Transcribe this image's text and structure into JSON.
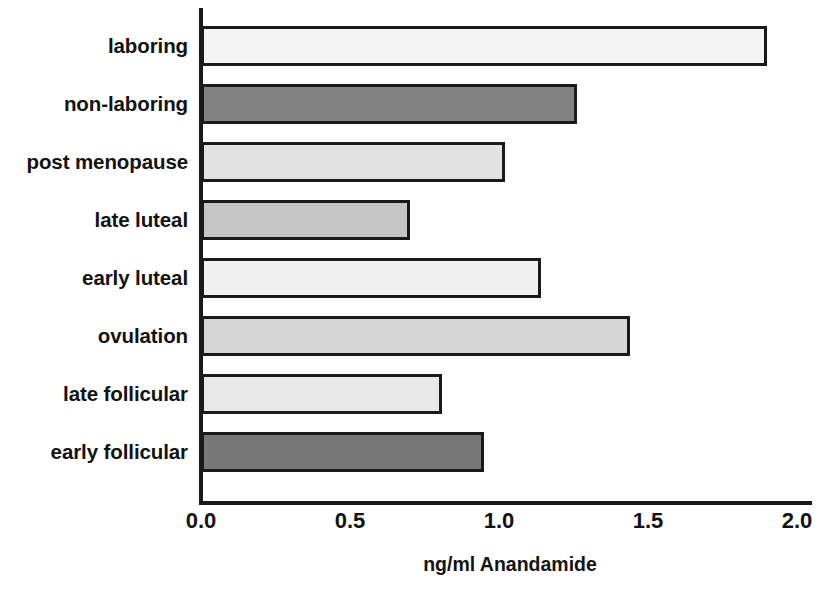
{
  "chart_data": {
    "type": "bar",
    "orientation": "horizontal",
    "title": "",
    "xlabel": "ng/ml Anandamide",
    "ylabel": "",
    "xlim": [
      0.0,
      2.0
    ],
    "xticks": [
      "0.0",
      "0.5",
      "1.0",
      "1.5",
      "2.0"
    ],
    "xtick_values": [
      0.0,
      0.5,
      1.0,
      1.5,
      2.0
    ],
    "grid": false,
    "legend": "none",
    "categories": [
      "laboring",
      "non-laboring",
      "post menopause",
      "late luteal",
      "early luteal",
      "ovulation",
      "late follicular",
      "early follicular"
    ],
    "values": [
      1.89,
      1.25,
      1.01,
      0.69,
      1.13,
      1.43,
      0.8,
      0.94
    ],
    "bar_colors": [
      "#f4f4f4",
      "#828282",
      "#e2e2e2",
      "#c6c6c6",
      "#f0f0f0",
      "#d6d6d6",
      "#e8e8e8",
      "#787878"
    ],
    "bar_edge_color": "#1a1a1a",
    "axis_color": "#1a1a1a",
    "background_color": "#ffffff",
    "bars": [
      {
        "label": "laboring",
        "value": 1.89,
        "color": "#f4f4f4"
      },
      {
        "label": "non-laboring",
        "value": 1.25,
        "color": "#828282"
      },
      {
        "label": "post menopause",
        "value": 1.01,
        "color": "#e2e2e2"
      },
      {
        "label": "late luteal",
        "value": 0.69,
        "color": "#c6c6c6"
      },
      {
        "label": "early luteal",
        "value": 1.13,
        "color": "#f0f0f0"
      },
      {
        "label": "ovulation",
        "value": 1.43,
        "color": "#d6d6d6"
      },
      {
        "label": "late follicular",
        "value": 0.8,
        "color": "#e8e8e8"
      },
      {
        "label": "early follicular",
        "value": 0.94,
        "color": "#787878"
      }
    ]
  }
}
